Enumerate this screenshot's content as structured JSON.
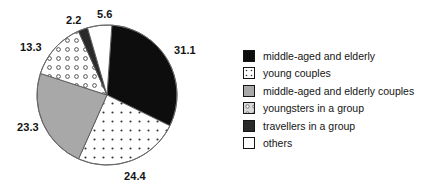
{
  "chart_data": {
    "type": "pie",
    "title": "",
    "subtitle": "",
    "xlabel": "",
    "ylabel": "",
    "grid": false,
    "legend_position": "right",
    "value_unit": "percent",
    "categories": [
      "middle-aged and elderly",
      "young couples",
      "middle-aged and elderly couples",
      "youngsters in a group",
      "travellers in a group",
      "others"
    ],
    "values": [
      31.1,
      24.4,
      23.3,
      13.3,
      2.2,
      5.6
    ],
    "slices": [
      {
        "label": "middle-aged and elderly",
        "value": 31.1,
        "value_text": "31.1",
        "fill": "solid-black",
        "color": "#0d0d0d"
      },
      {
        "label": "young couples",
        "value": 24.4,
        "value_text": "24.4",
        "fill": "fine-dots",
        "color": "#ffffff"
      },
      {
        "label": "middle-aged and elderly couples",
        "value": 23.3,
        "value_text": "23.3",
        "fill": "solid-gray",
        "color": "#a8a8a8"
      },
      {
        "label": "youngsters in a group",
        "value": 13.3,
        "value_text": "13.3",
        "fill": "open-circles",
        "color": "#ffffff"
      },
      {
        "label": "travellers in a group",
        "value": 2.2,
        "value_text": "2.2",
        "fill": "solid-dark-gray",
        "color": "#2a2a2a"
      },
      {
        "label": "others",
        "value": 5.6,
        "value_text": "5.6",
        "fill": "solid-white",
        "color": "#ffffff"
      }
    ]
  },
  "legend": {
    "items": [
      {
        "label": "middle-aged and elderly",
        "swatch": "solid-black"
      },
      {
        "label": "young couples",
        "swatch": "fine-dots"
      },
      {
        "label": "middle-aged and elderly couples",
        "swatch": "solid-gray"
      },
      {
        "label": "youngsters in a group",
        "swatch": "open-circles"
      },
      {
        "label": "travellers in a group",
        "swatch": "solid-dark-gray"
      },
      {
        "label": "others",
        "swatch": "solid-white"
      }
    ]
  },
  "colors": {
    "black": "#0d0d0d",
    "dark_gray": "#2a2a2a",
    "gray": "#a8a8a8",
    "white": "#ffffff",
    "outline": "#555555",
    "text": "#141414"
  }
}
